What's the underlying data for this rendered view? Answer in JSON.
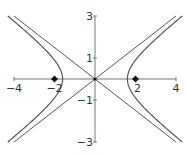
{
  "chart_data": {
    "type": "line",
    "title": "",
    "xlabel": "",
    "ylabel": "",
    "xlim": [
      -4,
      4
    ],
    "ylim": [
      -3,
      3
    ],
    "grid": false,
    "x_ticks": [
      {
        "value": -4,
        "label": "−4"
      },
      {
        "value": -2,
        "label": "−2"
      },
      {
        "value": 2,
        "label": "2"
      },
      {
        "value": 4,
        "label": "4"
      }
    ],
    "y_ticks": [
      {
        "value": 3,
        "label": "3"
      },
      {
        "value": 1,
        "label": "1"
      },
      {
        "value": -1,
        "label": "−1"
      },
      {
        "value": -3,
        "label": "−3"
      }
    ],
    "series": [
      {
        "name": "hyperbola",
        "equation": "x^2/1.6^2 - y^2/1.2^2 = 1",
        "a": 1.6,
        "b": 1.2,
        "y_range": [
          -3.0,
          3.0
        ]
      },
      {
        "name": "asymptote-positive",
        "equation": "y = 0.75x",
        "x": [
          -4,
          4
        ],
        "y": [
          -3,
          3
        ]
      },
      {
        "name": "asymptote-negative",
        "equation": "y = -0.75x",
        "x": [
          -4,
          4
        ],
        "y": [
          3,
          -3
        ]
      }
    ],
    "points": [
      {
        "name": "focus-left",
        "x": -2,
        "y": 0
      },
      {
        "name": "focus-right",
        "x": 2,
        "y": 0
      },
      {
        "name": "center",
        "x": 0,
        "y": 0
      }
    ]
  },
  "colors": {
    "curve": "#555555",
    "axis": "#777777",
    "point": "#111111",
    "text": "#333333"
  }
}
